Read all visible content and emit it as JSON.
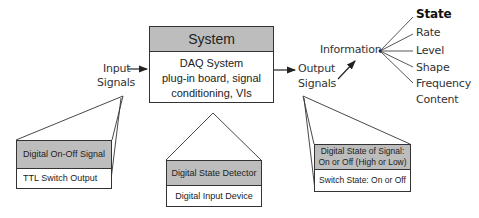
{
  "system_box": {
    "title": "System",
    "body_lines": [
      "DAQ System",
      "plug-in board, signal",
      "conditioning, VIs"
    ]
  },
  "input_label": {
    "line1": "Input",
    "line2": "Signals"
  },
  "output_label": {
    "line1": "Output",
    "line2": "Signals"
  },
  "information": {
    "label": "Information",
    "items": [
      {
        "label": "State",
        "emphasized": true
      },
      {
        "label": "Rate",
        "emphasized": false
      },
      {
        "label": "Level",
        "emphasized": false
      },
      {
        "label": "Shape",
        "emphasized": false
      },
      {
        "label": "Frequency",
        "emphasized": false
      },
      {
        "label": "Content",
        "emphasized": false
      }
    ]
  },
  "callouts": {
    "input": {
      "header": "Digital On-Off Signal",
      "body": "TTL Switch Output"
    },
    "system": {
      "header": "Digital State Detector",
      "body": "Digital Input Device"
    },
    "output": {
      "header_line1": "Digital State of Signal:",
      "header_line2": "On or Off (High or Low)",
      "body": "Switch State: On or Off"
    }
  },
  "colors": {
    "header_fill": "#bdbdbd",
    "stroke": "#333333",
    "background": "#ffffff"
  }
}
